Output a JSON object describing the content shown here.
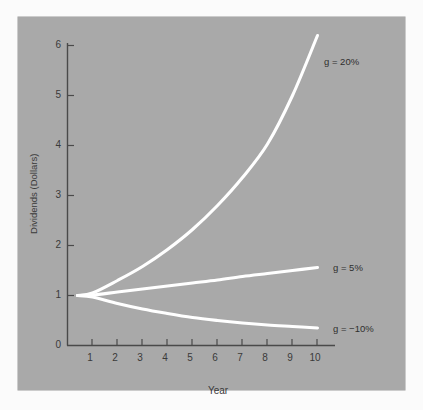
{
  "chart_data": {
    "type": "line",
    "title": "",
    "subtitle": "",
    "xlabel": "Year",
    "ylabel": "Dividends (Dollars)",
    "xlim": [
      0,
      10.6
    ],
    "ylim": [
      0,
      6.4
    ],
    "xticks": [
      "1",
      "2",
      "3",
      "4",
      "5",
      "6",
      "7",
      "8",
      "9",
      "10"
    ],
    "yticks": [
      "0",
      "1",
      "2",
      "3",
      "4",
      "5",
      "6"
    ],
    "grid": false,
    "legend_position": "inline-right-of-curve-ends",
    "background_color": "#a9a9a9",
    "line_color": "#ffffff",
    "text_color": "#3a3a3a",
    "x": [
      0.4,
      1,
      2,
      3,
      4,
      5,
      6,
      7,
      8,
      9,
      10
    ],
    "series": [
      {
        "name": "g = 20%",
        "growth_rate": 0.2,
        "values": [
          1.0,
          1.04,
          1.24,
          1.49,
          1.79,
          2.15,
          2.58,
          3.09,
          3.71,
          4.46,
          5.35
        ],
        "values_plotted": [
          1.0,
          1.05,
          1.3,
          1.58,
          1.92,
          2.32,
          2.8,
          3.36,
          4.03,
          5.0,
          6.2
        ],
        "label_text": "g = 20%",
        "label_x": 10.5,
        "label_y": 5.9
      },
      {
        "name": "g = 5%",
        "growth_rate": 0.05,
        "values": [
          1.0,
          1.01,
          1.06,
          1.11,
          1.17,
          1.23,
          1.29,
          1.35,
          1.42,
          1.49,
          1.56
        ],
        "values_plotted": [
          1.0,
          1.01,
          1.07,
          1.13,
          1.19,
          1.25,
          1.31,
          1.38,
          1.44,
          1.5,
          1.56
        ],
        "label_text": "g = 5%",
        "label_x": 10.5,
        "label_y": 1.54
      },
      {
        "name": "g = -10%",
        "growth_rate": -0.1,
        "values": [
          1.0,
          0.99,
          0.89,
          0.8,
          0.72,
          0.65,
          0.59,
          0.53,
          0.48,
          0.43,
          0.39
        ],
        "values_plotted": [
          1.0,
          0.97,
          0.84,
          0.73,
          0.64,
          0.56,
          0.5,
          0.45,
          0.41,
          0.38,
          0.35
        ],
        "label_text": "g = −10%",
        "label_x": 10.5,
        "label_y": 0.37
      }
    ]
  },
  "axes": {
    "y_title": "Dividends (Dollars)",
    "x_title": "Year",
    "y_tick_labels": [
      "0",
      "1",
      "2",
      "3",
      "4",
      "5",
      "6"
    ],
    "x_tick_labels": [
      "1",
      "2",
      "3",
      "4",
      "5",
      "6",
      "7",
      "8",
      "9",
      "10"
    ]
  },
  "annotations": {
    "label_20": "g = 20%",
    "label_5": "g = 5%",
    "label_neg10": "g = −10%"
  }
}
